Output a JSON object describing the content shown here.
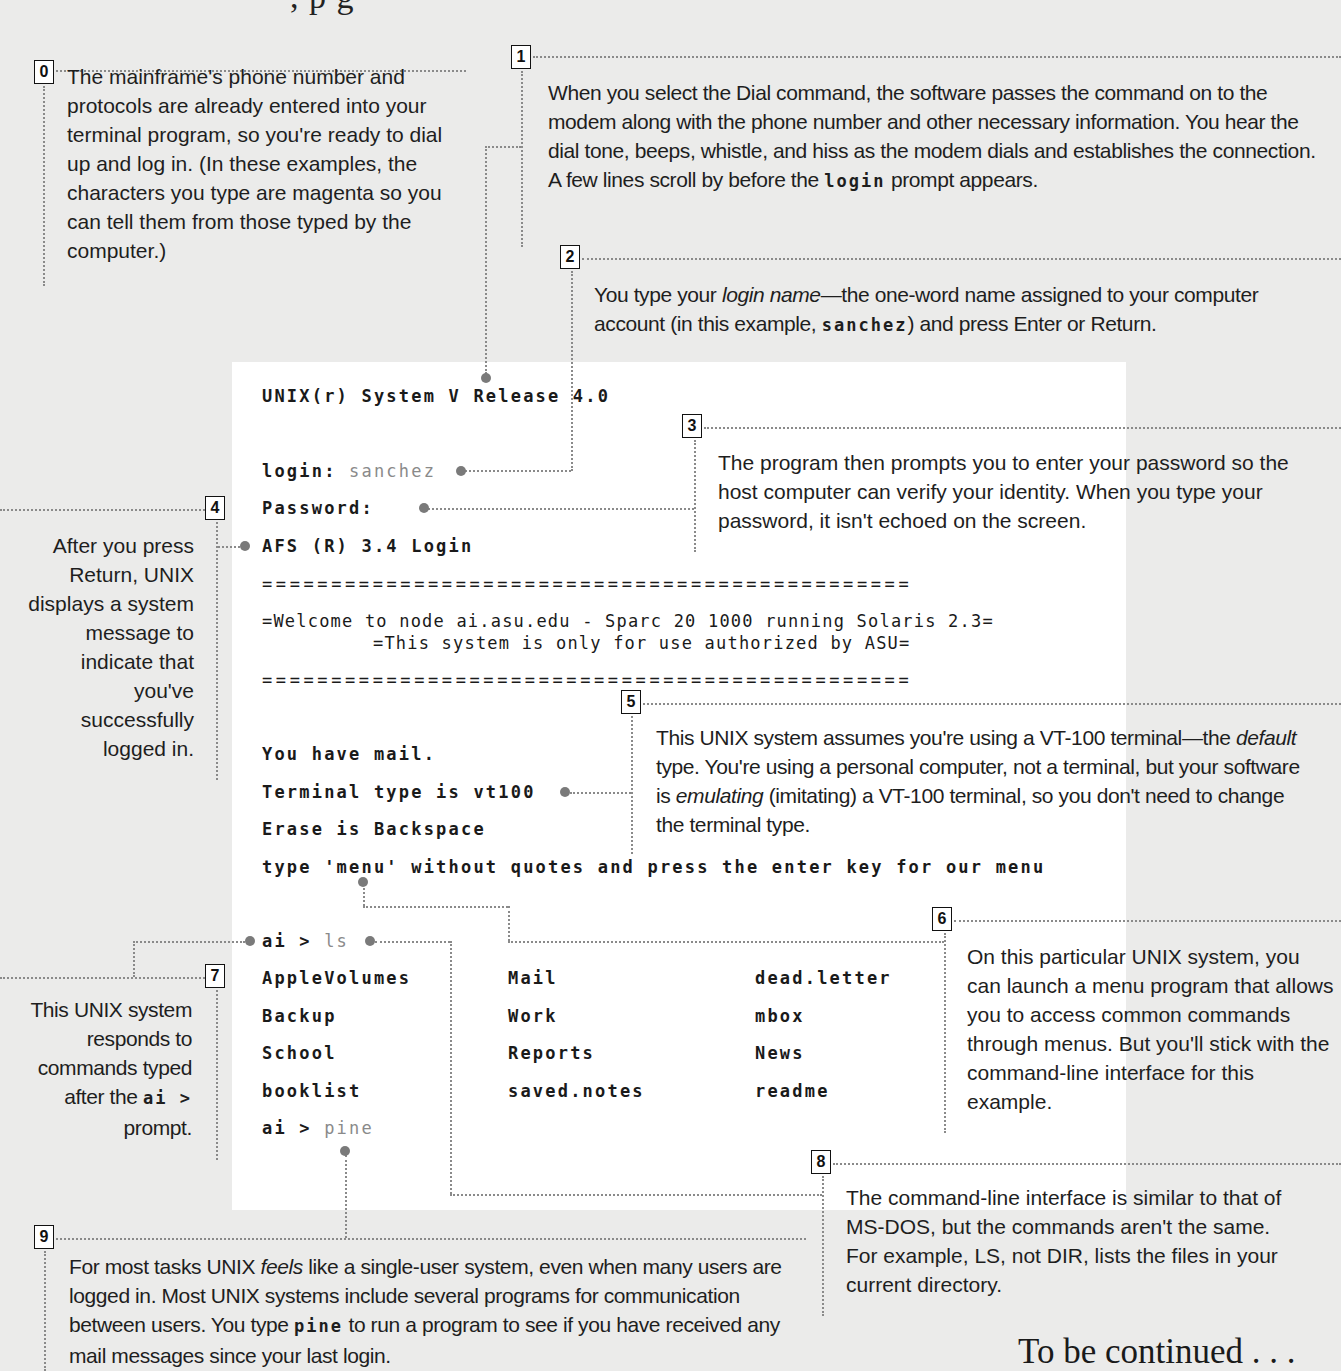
{
  "page": {
    "top_fragment": ",                              p g",
    "footer": "To be continued . . ."
  },
  "colors": {
    "background": "#ebebea",
    "terminal_background": "#ffffff",
    "typed_text": "#8a8a8a",
    "connector": "#8a8a8a"
  },
  "terminal": {
    "lines": {
      "release": "UNIX(r) System V Release 4.0",
      "login_prompt": "login: ",
      "login_typed": "sanchez",
      "password_prompt": "Password:",
      "afs": "AFS (R) 3.4 Login",
      "rule": "===============================================",
      "welcome": "=Welcome to node ai.asu.edu - Sparc 20 1000 running Solaris 2.3=",
      "authorized": "=This system is only for use authorized by ASU=",
      "mail": "You have mail.",
      "terminal_type": "Terminal type is vt100",
      "erase": "Erase is Backspace",
      "menu_hint": "type 'menu' without quotes and press the enter key for our menu",
      "prompt": "ai > ",
      "ls_typed": "ls",
      "pine_typed": "pine"
    },
    "ls_listing": [
      [
        "AppleVolumes",
        "Mail",
        "dead.letter"
      ],
      [
        "Backup",
        "Work",
        "mbox"
      ],
      [
        "School",
        "Reports",
        "News"
      ],
      [
        "booklist",
        "saved.notes",
        "readme"
      ]
    ]
  },
  "callouts": [
    {
      "number": "0",
      "text": "The mainframe's phone number and protocols are already entered into your terminal program, so you're ready to dial up and log in. (In these examples, the characters you type are magenta so you can tell them from those typed by the computer.)"
    },
    {
      "number": "1",
      "text_before": "When you select the Dial command, the software passes the command on to the modem along with the phone number and other necessary information. You hear the dial tone, beeps, whistle, and hiss as the modem dials and establishes the connection. A few lines scroll by before the ",
      "code": "login",
      "text_after": " prompt appears."
    },
    {
      "number": "2",
      "text_before": "You type your ",
      "italic": "login name",
      "text_mid": "—the one-word name assigned to your computer account (in this example, ",
      "code": "sanchez",
      "text_after": ") and press Enter or Return."
    },
    {
      "number": "3",
      "text": "The program then prompts you to enter your password so the host computer can verify your identity. When you type your password, it isn't echoed on the screen."
    },
    {
      "number": "4",
      "text": "After you press Return, UNIX displays a system message to indicate that you've successfully logged in."
    },
    {
      "number": "5",
      "text_1": "This UNIX system assumes you're using a VT-100 terminal—the ",
      "italic_1": "default",
      "text_2": " type. You're using a personal computer, not a terminal, but your software is ",
      "italic_2": "emulating",
      "text_3": " (imitating) a VT-100 terminal, so you don't need to change the terminal type."
    },
    {
      "number": "6",
      "text": "On this particular UNIX system, you can launch a menu program that allows you to access common commands through menus. But you'll stick with the command-line interface for this example."
    },
    {
      "number": "7",
      "text_before": "This UNIX system responds to commands typed after the ",
      "code": "ai >",
      "text_after": " prompt."
    },
    {
      "number": "8",
      "text": "The command-line interface is similar to that of MS-DOS, but the commands aren't the same. For example, LS, not DIR, lists the files in your current directory."
    },
    {
      "number": "9",
      "text_before": "For most tasks UNIX ",
      "italic": "feels",
      "text_mid": " like a single-user system, even when many users are logged in. Most UNIX systems include several programs for communication between users. You type ",
      "code": "pine",
      "text_after": " to run a program to see if you have received any mail messages since your last login."
    }
  ]
}
